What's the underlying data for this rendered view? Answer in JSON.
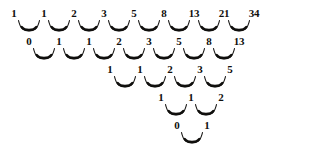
{
  "figure": {
    "ink_color": "#100f0d",
    "background_color": "#ffffff",
    "row_spacing_px": 28,
    "number_spacing_px": 30,
    "rows": [
      {
        "name": "row-1",
        "baseline_y": 19,
        "start_x": 14,
        "values": [
          "1",
          "1",
          "2",
          "3",
          "5",
          "8",
          "13",
          "21",
          "34"
        ]
      },
      {
        "name": "row-2",
        "baseline_y": 47,
        "start_x": 29,
        "values": [
          "0",
          "1",
          "1",
          "2",
          "3",
          "5",
          "8",
          "13"
        ]
      },
      {
        "name": "row-3",
        "baseline_y": 75,
        "start_x": 110,
        "values": [
          "1",
          "1",
          "2",
          "3",
          "5"
        ]
      },
      {
        "name": "row-4",
        "baseline_y": 103,
        "start_x": 161,
        "values": [
          "1",
          "1",
          "2"
        ]
      },
      {
        "name": "row-5",
        "baseline_y": 131,
        "start_x": 177,
        "values": [
          "0",
          "1"
        ]
      }
    ]
  }
}
